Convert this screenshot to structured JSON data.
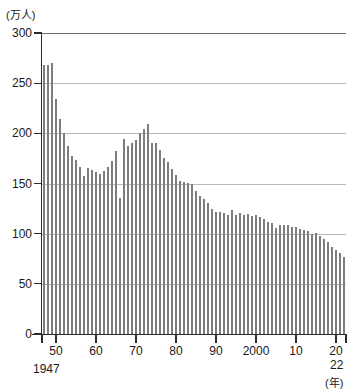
{
  "chart_data": {
    "type": "bar",
    "title": "",
    "subtitle": "",
    "xlabel": "(年)",
    "ylabel": "(万人)",
    "unit_label": "(万人)",
    "year_unit_label": "(年)",
    "ylim": [
      0,
      300
    ],
    "y_ticks": [
      0,
      50,
      100,
      150,
      200,
      250,
      300
    ],
    "y_tick_labels": [
      "0",
      "50",
      "100",
      "150",
      "200",
      "250",
      "300"
    ],
    "grid": true,
    "legend": null,
    "x_start_label": "1947",
    "x_end_label": "22",
    "x_tick_labels": [
      "50",
      "60",
      "70",
      "80",
      "90",
      "2000",
      "10",
      "20"
    ],
    "x_tick_years": [
      1950,
      1960,
      1970,
      1980,
      1990,
      2000,
      2010,
      2020
    ],
    "x_range": [
      1947,
      2022
    ],
    "bar_color": "#7d7d7d",
    "grid_color": "#b8b8b8",
    "axis_color": "#2b2b2b",
    "categories": [
      1947,
      1948,
      1949,
      1950,
      1951,
      1952,
      1953,
      1954,
      1955,
      1956,
      1957,
      1958,
      1959,
      1960,
      1961,
      1962,
      1963,
      1964,
      1965,
      1966,
      1967,
      1968,
      1969,
      1970,
      1971,
      1972,
      1973,
      1974,
      1975,
      1976,
      1977,
      1978,
      1979,
      1980,
      1981,
      1982,
      1983,
      1984,
      1985,
      1986,
      1987,
      1988,
      1989,
      1990,
      1991,
      1992,
      1993,
      1994,
      1995,
      1996,
      1997,
      1998,
      1999,
      2000,
      2001,
      2002,
      2003,
      2004,
      2005,
      2006,
      2007,
      2008,
      2009,
      2010,
      2011,
      2012,
      2013,
      2014,
      2015,
      2016,
      2017,
      2018,
      2019,
      2020,
      2021,
      2022
    ],
    "values": [
      268,
      268,
      270,
      234,
      214,
      200,
      187,
      177,
      173,
      166,
      157,
      165,
      163,
      161,
      159,
      162,
      166,
      172,
      182,
      136,
      194,
      187,
      190,
      193,
      200,
      204,
      209,
      190,
      190,
      183,
      175,
      171,
      164,
      158,
      153,
      152,
      151,
      150,
      143,
      138,
      135,
      131,
      125,
      122,
      122,
      121,
      119,
      124,
      119,
      121,
      119,
      120,
      118,
      119,
      117,
      115,
      112,
      111,
      106,
      109,
      109,
      109,
      107,
      107,
      105,
      104,
      103,
      100,
      101,
      98,
      95,
      92,
      87,
      84,
      81,
      77
    ],
    "annotations": [
      {
        "label": "第1次ベビーブーム",
        "year_range": [
          1947,
          1949
        ],
        "peak_value": 270
      },
      {
        "label": "ひのえうま",
        "year": 1966,
        "value": 136
      },
      {
        "label": "第2次ベビーブーム",
        "year_range": [
          1971,
          1974
        ],
        "peak_value": 209
      }
    ]
  }
}
